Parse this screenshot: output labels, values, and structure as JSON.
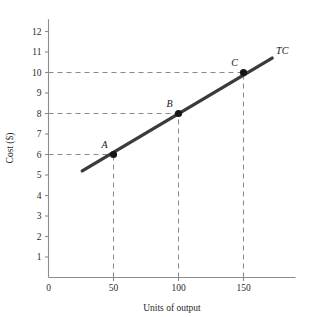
{
  "chart_data": {
    "type": "line",
    "title": "",
    "xlabel": "Units of output",
    "ylabel": "Cost ($)",
    "xlim": [
      0,
      190
    ],
    "ylim": [
      0,
      12.6
    ],
    "grid": false,
    "legend": "none",
    "x_ticks": [
      0,
      50,
      100,
      150
    ],
    "x_tick_labels": [
      "0",
      "50",
      "100",
      "150"
    ],
    "y_ticks": [
      1,
      2,
      3,
      4,
      5,
      6,
      7,
      8,
      9,
      10,
      11,
      12
    ],
    "y_tick_labels": [
      "1",
      "2",
      "3",
      "4",
      "5",
      "6",
      "7",
      "8",
      "9",
      "10",
      "11",
      "12"
    ],
    "series": [
      {
        "name": "TC",
        "label": "TC",
        "color": "#3b3b3b",
        "x": [
          26,
          172
        ],
        "values": [
          5.2,
          10.7
        ]
      }
    ],
    "points": [
      {
        "label": "A",
        "x": 50,
        "y": 6
      },
      {
        "label": "B",
        "x": 100,
        "y": 8
      },
      {
        "label": "C",
        "x": 150,
        "y": 10
      }
    ],
    "guides": [
      {
        "type": "horizontal",
        "y": 6,
        "from_x": 0,
        "to_x": 50
      },
      {
        "type": "horizontal",
        "y": 8,
        "from_x": 0,
        "to_x": 100
      },
      {
        "type": "horizontal",
        "y": 10,
        "from_x": 0,
        "to_x": 150
      },
      {
        "type": "vertical",
        "x": 50,
        "from_y": 0,
        "to_y": 6
      },
      {
        "type": "vertical",
        "x": 100,
        "from_y": 0,
        "to_y": 8
      },
      {
        "type": "vertical",
        "x": 150,
        "from_y": 0,
        "to_y": 10
      }
    ],
    "colors": {
      "line": "#3b3b3b",
      "marker": "#161616",
      "axis": "#8c8c8c",
      "guide": "#8a8a8a",
      "text": "#1a1a1a",
      "background": "#ffffff"
    }
  }
}
